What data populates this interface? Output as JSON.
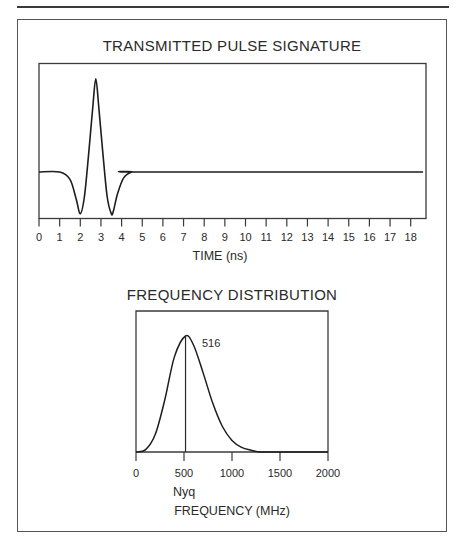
{
  "chart_data": [
    {
      "type": "line",
      "title": "TRANSMITTED PULSE SIGNATURE",
      "xlabel": "TIME (ns)",
      "ylabel": "",
      "xlim": [
        0,
        18.6
      ],
      "x_ticks": [
        0,
        1,
        2,
        3,
        4,
        5,
        6,
        7,
        8,
        9,
        10,
        11,
        12,
        13,
        14,
        15,
        16,
        17,
        18
      ],
      "x_tick_labels": [
        "0",
        "1",
        "2",
        "3",
        "4",
        "5",
        "6",
        "7",
        "8",
        "9",
        "10",
        "11",
        "12",
        "13",
        "14",
        "15",
        "16",
        "17",
        "18"
      ],
      "grid": false,
      "description": "Ricker-like wavelet: flat baseline, negative lobe near 2.0 ns, positive peak near 2.75 ns, negative lobe near 3.6 ns, returns to baseline by ~4.5 ns",
      "series": [
        {
          "name": "pulse",
          "x": [
            0,
            1.0,
            1.5,
            1.8,
            2.0,
            2.2,
            2.4,
            2.6,
            2.75,
            2.9,
            3.1,
            3.3,
            3.5,
            3.6,
            3.8,
            4.1,
            4.5,
            5.0,
            18.6
          ],
          "y": [
            0,
            0,
            -0.15,
            -0.55,
            -0.85,
            -0.5,
            0.35,
            1.3,
            1.9,
            1.3,
            0.35,
            -0.5,
            -0.85,
            -0.8,
            -0.45,
            -0.12,
            0,
            0,
            0
          ]
        }
      ]
    },
    {
      "type": "line",
      "title": "FREQUENCY DISTRIBUTION",
      "xlabel": "FREQUENCY (MHz)",
      "xlabel_secondary": "Nyq",
      "ylabel": "",
      "xlim": [
        0,
        2000
      ],
      "x_ticks": [
        0,
        500,
        1000,
        1500,
        2000
      ],
      "x_tick_labels": [
        "0",
        "500",
        "1000",
        "1500",
        "2000"
      ],
      "grid": false,
      "annotations": [
        {
          "text": "516",
          "x": 516,
          "note": "peak frequency marker (vertical line)"
        }
      ],
      "series": [
        {
          "name": "amplitude spectrum",
          "x": [
            0,
            100,
            200,
            300,
            400,
            516,
            600,
            700,
            800,
            900,
            1000,
            1100,
            1200,
            1300,
            1500,
            2000
          ],
          "y": [
            0,
            0.02,
            0.15,
            0.45,
            0.82,
            1.0,
            0.92,
            0.68,
            0.42,
            0.22,
            0.1,
            0.04,
            0.015,
            0.0,
            0.0,
            0.0
          ]
        }
      ]
    }
  ],
  "top_chart": {
    "title": "TRANSMITTED PULSE SIGNATURE",
    "xlabel": "TIME (ns)",
    "ticks": [
      "0",
      "1",
      "2",
      "3",
      "4",
      "5",
      "6",
      "7",
      "8",
      "9",
      "10",
      "11",
      "12",
      "13",
      "14",
      "15",
      "16",
      "17",
      "18"
    ]
  },
  "bottom_chart": {
    "title": "FREQUENCY DISTRIBUTION",
    "peak_label": "516",
    "nyq_label": "Nyq",
    "xlabel": "FREQUENCY (MHz)",
    "ticks": [
      "0",
      "500",
      "1000",
      "1500",
      "2000"
    ]
  },
  "colors": {
    "ink": "#2a2a2a",
    "frame": "#555555",
    "background": "#ffffff"
  }
}
